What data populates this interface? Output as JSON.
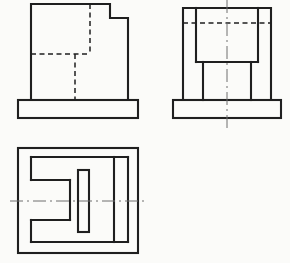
{
  "drawing": {
    "title": "orthographic-projection-three-views",
    "background_color": "#fbfbf9",
    "line_color": "#1f1f1f",
    "centerline_color": "#6e6e6e",
    "canvas": {
      "width": 290,
      "height": 263
    },
    "styles": {
      "solid": {
        "width": 2.1,
        "dash": ""
      },
      "hidden": {
        "width": 1.5,
        "dash": "5 3.5"
      },
      "center": {
        "width": 1,
        "dash": "13 4 2 4"
      }
    },
    "views": [
      {
        "id": "front-view",
        "label": "front view: stepped block on base plate with hidden slot lines",
        "rects": [
          {
            "x": 18,
            "y": 100,
            "w": 120,
            "h": 18,
            "style": "solid"
          }
        ],
        "polylines": [
          {
            "points": [
              [
                31,
                100
              ],
              [
                31,
                4
              ],
              [
                110,
                4
              ],
              [
                110,
                18
              ],
              [
                128,
                18
              ],
              [
                128,
                100
              ]
            ],
            "style": "solid"
          }
        ],
        "lines": [
          {
            "x1": 90,
            "y1": 4,
            "x2": 90,
            "y2": 54,
            "style": "hidden"
          },
          {
            "x1": 31,
            "y1": 54,
            "x2": 90,
            "y2": 54,
            "style": "hidden"
          },
          {
            "x1": 75,
            "y1": 54,
            "x2": 75,
            "y2": 100,
            "style": "hidden"
          }
        ]
      },
      {
        "id": "side-view",
        "label": "side view: block with top pocket, two legs, base plate and vertical centerline",
        "rects": [
          {
            "x": 173,
            "y": 100,
            "w": 108,
            "h": 18,
            "style": "solid"
          }
        ],
        "polylines": [
          {
            "points": [
              [
                183,
                100
              ],
              [
                183,
                8
              ],
              [
                271,
                8
              ],
              [
                271,
                100
              ]
            ],
            "style": "solid"
          }
        ],
        "lines": [
          {
            "x1": 196,
            "y1": 8,
            "x2": 196,
            "y2": 62,
            "style": "solid"
          },
          {
            "x1": 258,
            "y1": 8,
            "x2": 258,
            "y2": 62,
            "style": "solid"
          },
          {
            "x1": 196,
            "y1": 62,
            "x2": 258,
            "y2": 62,
            "style": "solid"
          },
          {
            "x1": 203,
            "y1": 62,
            "x2": 203,
            "y2": 100,
            "style": "solid"
          },
          {
            "x1": 251,
            "y1": 62,
            "x2": 251,
            "y2": 100,
            "style": "solid"
          },
          {
            "x1": 183,
            "y1": 23,
            "x2": 271,
            "y2": 23,
            "style": "hidden"
          },
          {
            "x1": 227,
            "y1": 0,
            "x2": 227,
            "y2": 131,
            "style": "center"
          }
        ]
      },
      {
        "id": "top-view",
        "label": "top view: base outline, block with left-opening U slot, narrow bar, step line and horizontal centerline",
        "rects": [
          {
            "x": 18,
            "y": 148,
            "w": 120,
            "h": 105,
            "style": "solid"
          },
          {
            "x": 78,
            "y": 170,
            "w": 11,
            "h": 62,
            "style": "solid"
          }
        ],
        "polylines": [],
        "lines": [
          {
            "x1": 31,
            "y1": 157,
            "x2": 128,
            "y2": 157,
            "style": "solid"
          },
          {
            "x1": 31,
            "y1": 242,
            "x2": 128,
            "y2": 242,
            "style": "solid"
          },
          {
            "x1": 128,
            "y1": 157,
            "x2": 128,
            "y2": 242,
            "style": "solid"
          },
          {
            "x1": 31,
            "y1": 157,
            "x2": 31,
            "y2": 180,
            "style": "solid"
          },
          {
            "x1": 31,
            "y1": 220,
            "x2": 31,
            "y2": 242,
            "style": "solid"
          },
          {
            "x1": 31,
            "y1": 180,
            "x2": 70,
            "y2": 180,
            "style": "solid"
          },
          {
            "x1": 70,
            "y1": 180,
            "x2": 70,
            "y2": 220,
            "style": "solid"
          },
          {
            "x1": 31,
            "y1": 220,
            "x2": 70,
            "y2": 220,
            "style": "solid"
          },
          {
            "x1": 114,
            "y1": 157,
            "x2": 114,
            "y2": 242,
            "style": "solid"
          },
          {
            "x1": 10,
            "y1": 201,
            "x2": 148,
            "y2": 201,
            "style": "center"
          }
        ]
      }
    ]
  }
}
